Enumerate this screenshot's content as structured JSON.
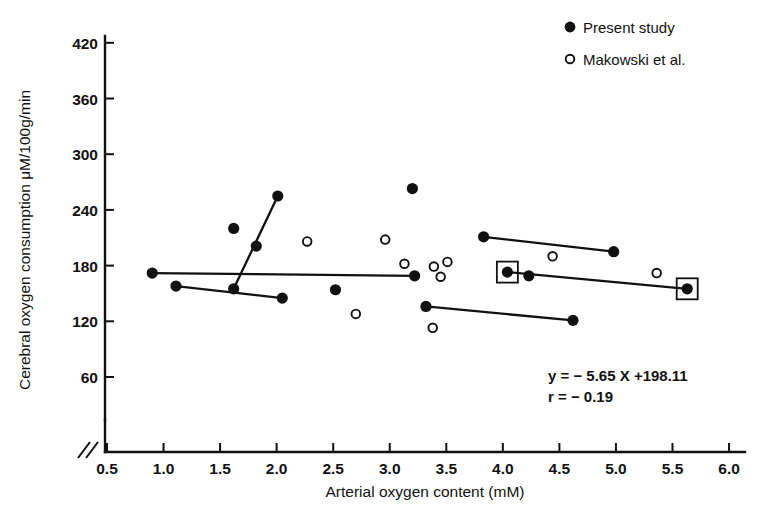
{
  "chart_data": {
    "type": "scatter",
    "title": "",
    "xlabel": "Arterial oxygen content (mM)",
    "ylabel": "Cerebral oxygen consumption μM/100g/min",
    "xlim": [
      0.5,
      6.0
    ],
    "ylim": [
      60,
      420
    ],
    "xticks": [
      "0.5",
      "1.0",
      "1.5",
      "2.0",
      "2.5",
      "3.0",
      "3.5",
      "4.0",
      "4.5",
      "5.0",
      "5.5",
      "6.0"
    ],
    "xtick_values": [
      0.5,
      1.0,
      1.5,
      2.0,
      2.5,
      3.0,
      3.5,
      4.0,
      4.5,
      5.0,
      5.5,
      6.0
    ],
    "yticks": [
      "60",
      "120",
      "180",
      "240",
      "300",
      "360",
      "420"
    ],
    "ytick_values": [
      60,
      120,
      180,
      240,
      300,
      360,
      420
    ],
    "grid": false,
    "axis_break_x": true,
    "axis_break_y": true,
    "legend_position": "top-right",
    "series": [
      {
        "name": "Present study",
        "marker": "filled-circle",
        "color": "#111111",
        "points": [
          {
            "x": 0.9,
            "y": 172
          },
          {
            "x": 1.11,
            "y": 158
          },
          {
            "x": 1.62,
            "y": 220
          },
          {
            "x": 1.62,
            "y": 155
          },
          {
            "x": 1.82,
            "y": 201
          },
          {
            "x": 2.01,
            "y": 255
          },
          {
            "x": 2.05,
            "y": 145
          },
          {
            "x": 2.52,
            "y": 154
          },
          {
            "x": 3.2,
            "y": 263
          },
          {
            "x": 3.22,
            "y": 169
          },
          {
            "x": 3.32,
            "y": 136
          },
          {
            "x": 3.83,
            "y": 211
          },
          {
            "x": 4.04,
            "y": 173
          },
          {
            "x": 4.23,
            "y": 169
          },
          {
            "x": 4.62,
            "y": 121
          },
          {
            "x": 4.98,
            "y": 195
          },
          {
            "x": 5.63,
            "y": 155
          }
        ]
      },
      {
        "name": "Makowski et al.",
        "marker": "open-circle",
        "color": "#111111",
        "points": [
          {
            "x": 2.27,
            "y": 206
          },
          {
            "x": 2.7,
            "y": 128
          },
          {
            "x": 2.96,
            "y": 208
          },
          {
            "x": 3.13,
            "y": 182
          },
          {
            "x": 3.38,
            "y": 113
          },
          {
            "x": 3.39,
            "y": 179
          },
          {
            "x": 3.51,
            "y": 184
          },
          {
            "x": 3.45,
            "y": 168
          },
          {
            "x": 4.44,
            "y": 190
          },
          {
            "x": 5.36,
            "y": 172
          }
        ]
      }
    ],
    "connected_pairs": [
      {
        "from": {
          "x": 0.9,
          "y": 172
        },
        "to": {
          "x": 3.22,
          "y": 169
        }
      },
      {
        "from": {
          "x": 1.11,
          "y": 158
        },
        "to": {
          "x": 2.05,
          "y": 145
        }
      },
      {
        "from": {
          "x": 1.62,
          "y": 155
        },
        "to": {
          "x": 2.01,
          "y": 255
        }
      },
      {
        "from": {
          "x": 3.83,
          "y": 211
        },
        "to": {
          "x": 4.98,
          "y": 195
        }
      },
      {
        "from": {
          "x": 4.04,
          "y": 173
        },
        "to": {
          "x": 5.63,
          "y": 155
        }
      },
      {
        "from": {
          "x": 3.32,
          "y": 136
        },
        "to": {
          "x": 4.62,
          "y": 121
        }
      }
    ],
    "boxed_points": [
      {
        "x": 4.04,
        "y": 173
      },
      {
        "x": 5.63,
        "y": 155
      }
    ],
    "annotations": [
      {
        "text": "y = − 5.65 X +198.11"
      },
      {
        "text": "r = − 0.19"
      }
    ]
  },
  "legend": {
    "entries": [
      {
        "label": "Present study",
        "marker": "filled-circle"
      },
      {
        "label": "Makowski et al.",
        "marker": "open-circle"
      }
    ]
  }
}
